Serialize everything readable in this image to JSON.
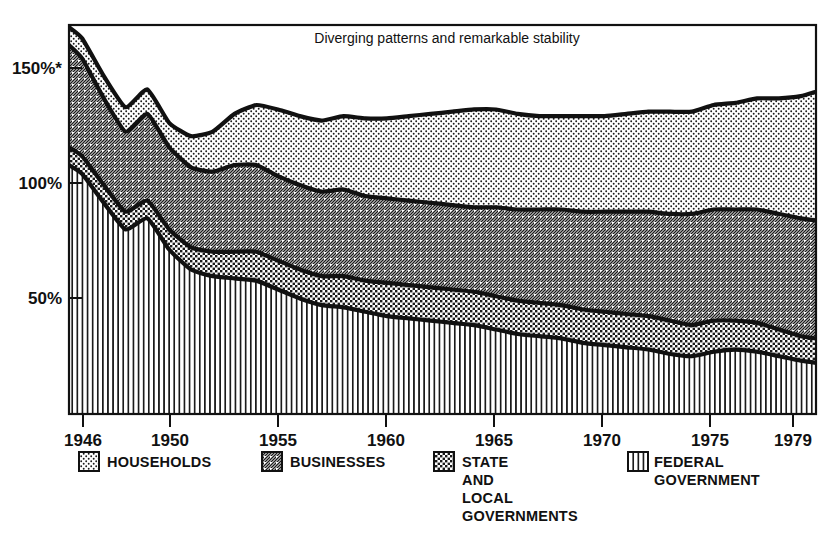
{
  "chart_data": {
    "type": "area",
    "title": "Diverging patterns and remarkable stability",
    "xlabel": "",
    "ylabel": "",
    "stacked": true,
    "grid": false,
    "legend_position": "bottom",
    "xlim": [
      1945.4,
      1979.7
    ],
    "ylim": [
      0,
      175
    ],
    "xticks": [
      1946,
      1950,
      1955,
      1960,
      1965,
      1970,
      1975,
      1979
    ],
    "xticklabels": [
      "1946",
      "1950",
      "1955",
      "1960",
      "1965",
      "1970",
      "1975",
      "1979"
    ],
    "yticks": [
      50,
      100,
      150
    ],
    "yticklabels": [
      "50%",
      "100%",
      "150%*"
    ],
    "x": [
      1945.4,
      1946,
      1947,
      1948,
      1949,
      1950,
      1951,
      1952,
      1953,
      1954,
      1955,
      1956,
      1957,
      1958,
      1959,
      1960,
      1961,
      1962,
      1963,
      1964,
      1965,
      1966,
      1967,
      1968,
      1969,
      1970,
      1971,
      1972,
      1973,
      1974,
      1975,
      1976,
      1977,
      1978,
      1979,
      1979.7
    ],
    "series": [
      {
        "name": "FEDERAL GOVERNMENT",
        "pattern": "vertical-lines",
        "values": [
          112,
          108,
          95,
          83,
          88,
          74,
          65,
          62,
          61,
          60,
          56,
          52,
          49,
          48,
          46,
          44,
          43,
          42,
          41,
          40,
          38,
          36,
          35,
          34,
          32,
          31,
          30,
          29,
          27,
          26,
          28,
          29,
          28,
          26,
          24,
          23
        ]
      },
      {
        "name": "STATE AND LOCAL GOVERNMENTS",
        "pattern": "coarse-dots",
        "values": [
          8,
          8,
          8,
          8,
          8,
          9,
          10,
          11,
          12,
          13,
          13,
          13,
          13,
          14,
          14,
          15,
          15,
          15,
          15,
          15,
          15,
          15,
          15,
          15,
          15,
          15,
          15,
          15,
          15,
          14,
          14,
          13,
          13,
          12,
          11,
          11
        ]
      },
      {
        "name": "BUSINESSES",
        "pattern": "diagonal-hatch",
        "values": [
          46,
          44,
          39,
          36,
          39,
          37,
          36,
          36,
          39,
          39,
          38,
          38,
          38,
          39,
          38,
          38,
          38,
          38,
          38,
          38,
          40,
          41,
          42,
          43,
          44,
          45,
          46,
          47,
          48,
          50,
          50,
          50,
          51,
          52,
          53,
          53
        ]
      },
      {
        "name": "HOUSEHOLDS",
        "pattern": "fine-dots",
        "values": [
          8,
          9,
          10,
          11,
          11,
          11,
          14,
          18,
          23,
          27,
          30,
          31,
          32,
          33,
          35,
          36,
          38,
          40,
          42,
          44,
          44,
          43,
          42,
          42,
          43,
          43,
          44,
          45,
          46,
          46,
          47,
          48,
          50,
          52,
          55,
          58
        ]
      }
    ],
    "totals_note": "Values are percent of GNP; series are stacked bottom-to-top: Federal Government, State and Local Governments, Businesses, Households."
  },
  "legend": {
    "items": [
      {
        "id": "households",
        "label": "HOUSEHOLDS",
        "swatch": "fine-dots-swatch"
      },
      {
        "id": "businesses",
        "label": "BUSINESSES",
        "swatch": "diagonal-hatch-swatch"
      },
      {
        "id": "state-local",
        "label": "STATE\nAND\nLOCAL\nGOVERNMENTS",
        "line1": "STATE",
        "line2": "AND",
        "line3": "LOCAL",
        "line4": "GOVERNMENTS",
        "swatch": "coarse-dots-swatch"
      },
      {
        "id": "federal",
        "label": "FEDERAL\nGOVERNMENT",
        "line1": "FEDERAL",
        "line2": "GOVERNMENT",
        "swatch": "vertical-lines-swatch"
      }
    ]
  },
  "axes": {
    "y": {
      "t150": "150%*",
      "t100": "100%",
      "t50": "50%"
    },
    "x": {
      "y1946": "1946",
      "y1950": "1950",
      "y1955": "1955",
      "y1960": "1960",
      "y1965": "1965",
      "y1970": "1970",
      "y1975": "1975",
      "y1979": "1979"
    }
  },
  "colors": {
    "ink": "#111111",
    "paper": "#ffffff"
  }
}
